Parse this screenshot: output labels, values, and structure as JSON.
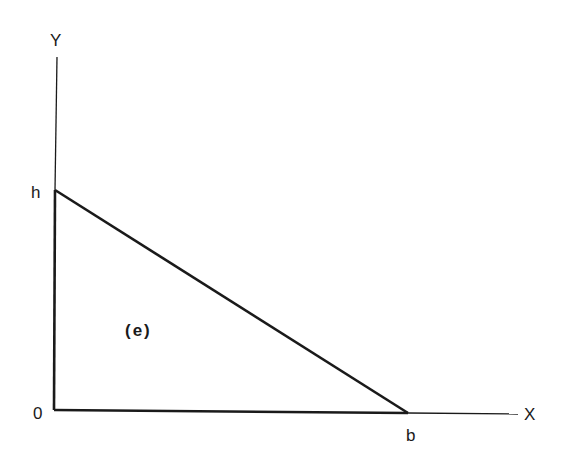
{
  "diagram": {
    "type": "triangle-in-axes",
    "axes": {
      "x_label": "X",
      "y_label": "Y",
      "origin_label": "0"
    },
    "vertices": {
      "height_label": "h",
      "base_label": "b"
    },
    "region_label": "(e)",
    "colors": {
      "ink": "#1a1a1a",
      "background": "#ffffff"
    }
  }
}
